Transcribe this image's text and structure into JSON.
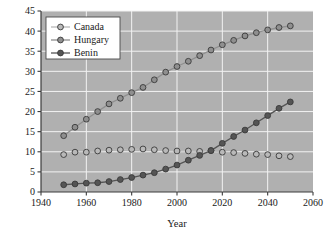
{
  "chart_data": {
    "type": "line",
    "title": "",
    "xlabel": "Year",
    "ylabel": "",
    "xlim": [
      1940,
      2060
    ],
    "ylim": [
      0,
      45
    ],
    "xticks": [
      1940,
      1960,
      1980,
      2000,
      2020,
      2040,
      2060
    ],
    "yticks": [
      0,
      5,
      10,
      15,
      20,
      25,
      30,
      35,
      40,
      45
    ],
    "grid": true,
    "legend_position": "upper-left",
    "x": [
      1950,
      1955,
      1960,
      1965,
      1970,
      1975,
      1980,
      1985,
      1990,
      1995,
      2000,
      2005,
      2010,
      2015,
      2020,
      2025,
      2030,
      2035,
      2040,
      2045,
      2050
    ],
    "series": [
      {
        "name": "Canada",
        "color": "#b9b9b9",
        "values": [
          9.3,
          9.9,
          9.9,
          10.2,
          10.4,
          10.5,
          10.6,
          10.7,
          10.5,
          10.3,
          10.2,
          10.2,
          10.1,
          10.3,
          9.9,
          9.8,
          9.6,
          9.4,
          9.3,
          9.0,
          8.8
        ]
      },
      {
        "name": "Hungary",
        "color": "#8f8f8f",
        "values": [
          14.0,
          16.1,
          18.1,
          20.0,
          21.9,
          23.3,
          24.7,
          26.0,
          27.9,
          29.8,
          31.2,
          32.5,
          33.9,
          35.3,
          36.6,
          37.7,
          38.8,
          39.6,
          40.3,
          40.9,
          41.3
        ]
      },
      {
        "name": "Benin",
        "color": "#555555",
        "values": [
          1.8,
          2.0,
          2.2,
          2.3,
          2.6,
          3.1,
          3.6,
          4.2,
          4.8,
          5.7,
          6.7,
          7.9,
          9.1,
          10.3,
          12.1,
          13.8,
          15.4,
          17.2,
          19.0,
          20.8,
          22.4
        ]
      }
    ]
  },
  "legend": {
    "items": [
      {
        "label": "Canada"
      },
      {
        "label": "Hungary"
      },
      {
        "label": "Benin"
      }
    ]
  },
  "axes": {
    "x_title": "Year",
    "x_tick_labels": [
      "1940",
      "1960",
      "1980",
      "2000",
      "2020",
      "2040",
      "2060"
    ],
    "y_tick_labels": [
      "0",
      "5",
      "10",
      "15",
      "20",
      "25",
      "30",
      "35",
      "40",
      "45"
    ]
  },
  "style": {
    "plot_background": "#b0b0b0",
    "gridline_color": "#f2f2f2",
    "axis_color": "#3c3c3c",
    "page_background": "#ffffff"
  }
}
